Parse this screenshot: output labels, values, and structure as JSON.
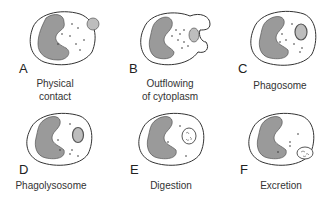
{
  "figure": {
    "panels": [
      {
        "letter": "A",
        "caption_lines": [
          "Physical",
          "contact"
        ]
      },
      {
        "letter": "B",
        "caption_lines": [
          "Outflowing",
          "of cytoplasm"
        ]
      },
      {
        "letter": "C",
        "caption_lines": [
          "Phagosome"
        ]
      },
      {
        "letter": "D",
        "caption_lines": [
          "Phagolysosome"
        ]
      },
      {
        "letter": "E",
        "caption_lines": [
          "Digestion"
        ]
      },
      {
        "letter": "F",
        "caption_lines": [
          "Excretion"
        ]
      }
    ],
    "colors": {
      "nucleus": "#9a9a9a",
      "outline": "#333333",
      "particle": "#bdbdbd",
      "cell_fill": "#ffffff"
    }
  }
}
